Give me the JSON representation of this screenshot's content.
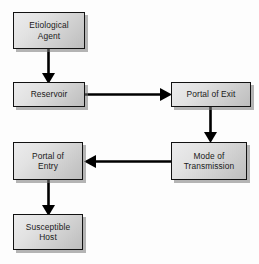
{
  "diagram": {
    "background_color": "#fdfdfd",
    "box_border_color": "#121212",
    "box_fill_light": "#ececed",
    "box_fill_dark": "#bdbdbd",
    "shadow_color": "#787878",
    "arrow_color": "#000000",
    "nodes": [
      {
        "id": "etiological-agent",
        "label": "Etiological\nAgent"
      },
      {
        "id": "reservoir",
        "label": "Reservoir"
      },
      {
        "id": "portal-of-exit",
        "label": "Portal of Exit"
      },
      {
        "id": "mode-of-transmission",
        "label": "Mode of\nTransmission"
      },
      {
        "id": "portal-of-entry",
        "label": "Portal of\nEntry"
      },
      {
        "id": "susceptible-host",
        "label": "Susceptible\nHost"
      }
    ],
    "edges": [
      {
        "id": "edge-agent-to-reservoir",
        "from": "etiological-agent",
        "to": "reservoir",
        "direction": "down"
      },
      {
        "id": "edge-reservoir-to-exit",
        "from": "reservoir",
        "to": "portal-of-exit",
        "direction": "right"
      },
      {
        "id": "edge-exit-to-mode",
        "from": "portal-of-exit",
        "to": "mode-of-transmission",
        "direction": "down"
      },
      {
        "id": "edge-mode-to-entry",
        "from": "mode-of-transmission",
        "to": "portal-of-entry",
        "direction": "left"
      },
      {
        "id": "edge-entry-to-host",
        "from": "portal-of-entry",
        "to": "susceptible-host",
        "direction": "down"
      }
    ]
  }
}
